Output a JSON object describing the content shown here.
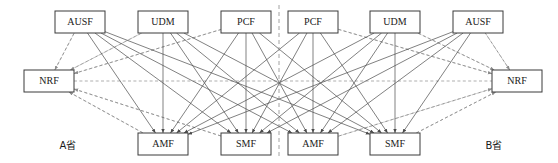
{
  "figure": {
    "type": "network-topology-diagram",
    "width": 558,
    "height": 163,
    "background_color": "#ffffff"
  },
  "legend_styles": {
    "solid_edge": {
      "meaning": "service-based interface link between network functions",
      "color": "#4a4a4a",
      "style": "solid"
    },
    "dashed_edge": {
      "meaning": "NRF registration / discovery link",
      "color": "#8c8c8c",
      "style": "dashed"
    },
    "divider": {
      "meaning": "province boundary",
      "color": "#8c8c8c",
      "style": "dashed"
    }
  },
  "provinces": [
    {
      "id": "province-a",
      "label": "A省",
      "label_x": 68,
      "label_y": 146,
      "nodes": [
        {
          "id": "a-nrf",
          "label": "NRF",
          "x": 24,
          "y": 70,
          "w": 50,
          "h": 22,
          "row": "middle"
        },
        {
          "id": "a-ausf",
          "label": "AUSF",
          "x": 55,
          "y": 11,
          "w": 50,
          "h": 22,
          "row": "top"
        },
        {
          "id": "a-udm",
          "label": "UDM",
          "x": 138,
          "y": 11,
          "w": 50,
          "h": 22,
          "row": "top"
        },
        {
          "id": "a-pcf",
          "label": "PCF",
          "x": 221,
          "y": 11,
          "w": 50,
          "h": 22,
          "row": "top"
        },
        {
          "id": "a-amf",
          "label": "AMF",
          "x": 138,
          "y": 133,
          "w": 50,
          "h": 22,
          "row": "bottom"
        },
        {
          "id": "a-smf",
          "label": "SMF",
          "x": 221,
          "y": 133,
          "w": 50,
          "h": 22,
          "row": "bottom"
        }
      ]
    },
    {
      "id": "province-b",
      "label": "B省",
      "label_x": 494,
      "label_y": 146,
      "nodes": [
        {
          "id": "b-pcf",
          "label": "PCF",
          "x": 288,
          "y": 11,
          "w": 50,
          "h": 22,
          "row": "top"
        },
        {
          "id": "b-udm",
          "label": "UDM",
          "x": 370,
          "y": 11,
          "w": 50,
          "h": 22,
          "row": "top"
        },
        {
          "id": "b-ausf",
          "label": "AUSF",
          "x": 453,
          "y": 11,
          "w": 50,
          "h": 22,
          "row": "top"
        },
        {
          "id": "b-nrf",
          "label": "NRF",
          "x": 492,
          "y": 70,
          "w": 50,
          "h": 22,
          "row": "middle"
        },
        {
          "id": "b-amf",
          "label": "AMF",
          "x": 288,
          "y": 133,
          "w": 50,
          "h": 22,
          "row": "bottom"
        },
        {
          "id": "b-smf",
          "label": "SMF",
          "x": 370,
          "y": 133,
          "w": 50,
          "h": 22,
          "row": "bottom"
        }
      ]
    }
  ],
  "divider": {
    "x": 279,
    "y1": 5,
    "y2": 158
  },
  "solid_edges": [
    [
      "a-ausf",
      "a-amf"
    ],
    [
      "a-ausf",
      "a-smf"
    ],
    [
      "a-ausf",
      "b-amf"
    ],
    [
      "a-ausf",
      "b-smf"
    ],
    [
      "a-udm",
      "a-amf"
    ],
    [
      "a-udm",
      "a-smf"
    ],
    [
      "a-udm",
      "b-amf"
    ],
    [
      "a-udm",
      "b-smf"
    ],
    [
      "a-pcf",
      "a-amf"
    ],
    [
      "a-pcf",
      "a-smf"
    ],
    [
      "a-pcf",
      "b-amf"
    ],
    [
      "a-pcf",
      "b-smf"
    ],
    [
      "b-pcf",
      "a-amf"
    ],
    [
      "b-pcf",
      "a-smf"
    ],
    [
      "b-pcf",
      "b-amf"
    ],
    [
      "b-pcf",
      "b-smf"
    ],
    [
      "b-udm",
      "a-amf"
    ],
    [
      "b-udm",
      "a-smf"
    ],
    [
      "b-udm",
      "b-amf"
    ],
    [
      "b-udm",
      "b-smf"
    ],
    [
      "b-ausf",
      "a-amf"
    ],
    [
      "b-ausf",
      "a-smf"
    ],
    [
      "b-ausf",
      "b-amf"
    ],
    [
      "b-ausf",
      "b-smf"
    ]
  ],
  "dashed_edges": [
    [
      "a-nrf",
      "a-ausf"
    ],
    [
      "a-nrf",
      "a-udm"
    ],
    [
      "a-nrf",
      "a-pcf"
    ],
    [
      "a-nrf",
      "a-amf"
    ],
    [
      "a-nrf",
      "a-smf"
    ],
    [
      "a-nrf",
      "b-nrf"
    ],
    [
      "b-nrf",
      "b-ausf"
    ],
    [
      "b-nrf",
      "b-udm"
    ],
    [
      "b-nrf",
      "b-pcf"
    ],
    [
      "b-nrf",
      "b-amf"
    ],
    [
      "b-nrf",
      "b-smf"
    ]
  ],
  "arrow_edges": [
    [
      "a-ausf",
      "a-nrf"
    ],
    [
      "a-udm",
      "a-nrf"
    ],
    [
      "a-pcf",
      "a-nrf"
    ],
    [
      "a-amf",
      "a-nrf"
    ],
    [
      "a-smf",
      "a-nrf"
    ],
    [
      "b-ausf",
      "b-nrf"
    ],
    [
      "b-udm",
      "b-nrf"
    ],
    [
      "b-pcf",
      "b-nrf"
    ],
    [
      "b-amf",
      "b-nrf"
    ],
    [
      "b-smf",
      "b-nrf"
    ]
  ]
}
